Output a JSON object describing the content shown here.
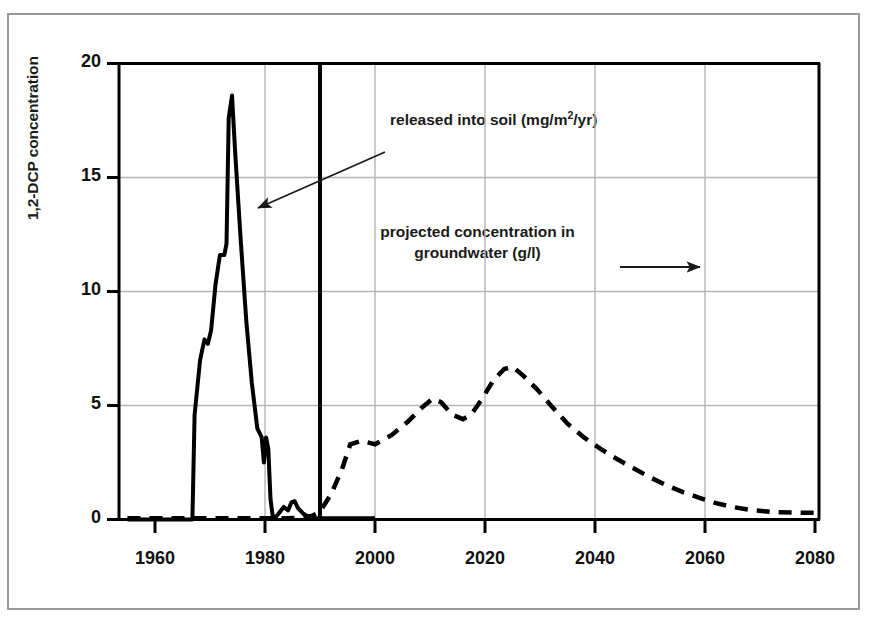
{
  "figure": {
    "has_outer_frame": true,
    "background_color": "#ffffff",
    "line_color": "#000000",
    "grid_color": "#b3b3b3"
  },
  "chart_data": {
    "type": "line",
    "title": "",
    "subtitle": "",
    "xlabel": "",
    "ylabel": "1,2-DCP concentration",
    "xlim": [
      1955,
      2085
    ],
    "ylim": [
      0,
      20
    ],
    "xticks": [
      1960,
      1980,
      2000,
      2020,
      2040,
      2060,
      2080
    ],
    "yticks": [
      0,
      5,
      10,
      15,
      20
    ],
    "xtick_labels": [
      "1960",
      "1980",
      "2000",
      "2020",
      "2040",
      "2060",
      "2080"
    ],
    "ytick_labels": [
      "0",
      "5",
      "10",
      "15",
      "20"
    ],
    "grid": true,
    "grid_axis": "both",
    "legend": "annotations-with-arrows",
    "annotations": [
      {
        "id": "annot-released-soil",
        "text": "released into soil (mg/m²/yr)",
        "text_plain": "released into soil (mg/m2/yr)",
        "arrow": "points down-left to solid series",
        "arrow_from": [
          1990,
          16.2
        ],
        "arrow_to": [
          1981.5,
          13.3
        ]
      },
      {
        "id": "annot-projected-groundwater",
        "text": "projected concentration in groundwater (g/l)",
        "line1": "projected concentration in",
        "line2": "groundwater (g/l)",
        "arrow": "points right to dashed series",
        "arrow_from": [
          2031,
          11.6
        ],
        "arrow_to": [
          2046,
          11.6
        ]
      }
    ],
    "series": [
      {
        "name": "released into soil (mg/m²/yr)",
        "style": "solid",
        "linewidth": 4,
        "color": "#000000",
        "x": [
          1955,
          1966.8,
          1967.2,
          1968.2,
          1969.0,
          1969.6,
          1970.2,
          1971.0,
          1971.8,
          1972.6,
          1973.0,
          1973.4,
          1974.0,
          1974.6,
          1975.6,
          1976.6,
          1977.6,
          1978.6,
          1979.4,
          1979.8,
          1980.2,
          1980.6,
          1981.0,
          1981.4,
          1982.0,
          1982.6,
          1983.4,
          1984.2,
          1984.8,
          1985.4,
          1986.0,
          1987.0,
          1988.0,
          1989.5,
          1991.0,
          1994.0,
          1997.0,
          2000.0
        ],
        "y": [
          0.0,
          0.0,
          4.6,
          7.0,
          7.9,
          7.7,
          8.3,
          10.3,
          11.6,
          11.6,
          12.1,
          17.6,
          18.6,
          16.0,
          12.2,
          8.7,
          6.0,
          4.0,
          3.6,
          2.5,
          3.6,
          3.1,
          0.9,
          0.15,
          0.12,
          0.3,
          0.55,
          0.4,
          0.75,
          0.8,
          0.5,
          0.25,
          0.1,
          0.05,
          0.05,
          0.05,
          0.05,
          0.05
        ]
      },
      {
        "name": "projected concentration in groundwater (g/l)",
        "style": "dashed",
        "linewidth": 4.5,
        "color": "#000000",
        "x": [
          1955,
          1980,
          1984,
          1986.5,
          1988.5,
          1990,
          1992,
          1994,
          1995.5,
          1997.5,
          2000,
          2003,
          2006,
          2008.5,
          2010.5,
          2012,
          2014,
          2016,
          2017.5,
          2019.5,
          2021.5,
          2023.5,
          2025,
          2027,
          2029.5,
          2032,
          2035,
          2038,
          2041,
          2044,
          2047,
          2050,
          2053,
          2056,
          2059,
          2062,
          2065,
          2068,
          2072,
          2076,
          2080
        ],
        "y": [
          0.05,
          0.05,
          0.05,
          0.08,
          0.15,
          0.35,
          1.1,
          2.2,
          3.3,
          3.45,
          3.3,
          3.7,
          4.3,
          4.9,
          5.3,
          5.15,
          4.6,
          4.4,
          4.6,
          5.3,
          6.1,
          6.6,
          6.7,
          6.3,
          5.7,
          5.0,
          4.2,
          3.6,
          3.1,
          2.65,
          2.25,
          1.85,
          1.5,
          1.2,
          0.95,
          0.72,
          0.55,
          0.43,
          0.33,
          0.3,
          0.3
        ]
      }
    ],
    "vertical_marker": {
      "x": 1990,
      "style": "solid",
      "linewidth": 4,
      "color": "#000000",
      "description": "thick vertical divider separating measured and projected periods"
    }
  }
}
